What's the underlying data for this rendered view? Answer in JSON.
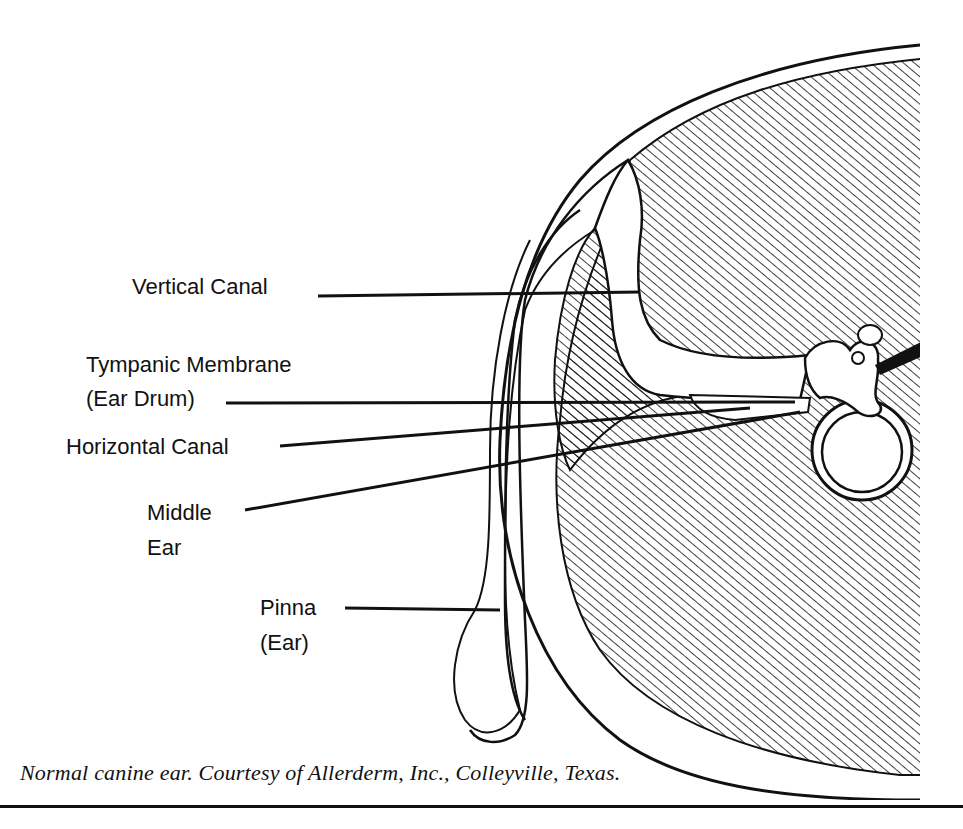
{
  "figure": {
    "title": "Normal canine ear",
    "labels": [
      {
        "id": "vertical-canal",
        "lines": [
          "Vertical Canal"
        ]
      },
      {
        "id": "tympanic-membrane",
        "lines": [
          "Tympanic Membrane",
          "(Ear Drum)"
        ]
      },
      {
        "id": "horizontal-canal",
        "lines": [
          "Horizontal Canal"
        ]
      },
      {
        "id": "middle-ear",
        "lines": [
          "Middle",
          "Ear"
        ]
      },
      {
        "id": "pinna",
        "lines": [
          "Pinna",
          "(Ear)"
        ]
      }
    ],
    "caption": "Normal canine ear. Courtesy of Allerderm, Inc., Colleyville, Texas."
  },
  "colors": {
    "ink": "#111111",
    "paper": "#ffffff"
  }
}
